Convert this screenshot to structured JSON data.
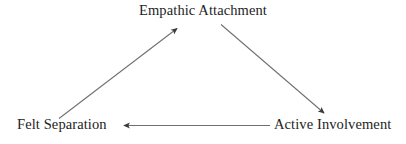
{
  "diagram": {
    "type": "cycle-triangle",
    "background_color": "#ffffff",
    "line_color": "#6b6b6b",
    "text_color": "#232323",
    "nodes": [
      {
        "id": "empathic-attachment",
        "label": "Empathic Attachment",
        "position": "top"
      },
      {
        "id": "felt-separation",
        "label": "Felt Separation",
        "position": "bottom-left"
      },
      {
        "id": "active-involvement",
        "label": "Active Involvement",
        "position": "bottom-right"
      }
    ],
    "edges": [
      {
        "id": "felt-separation-to-empathic-attachment",
        "from": "Felt Separation",
        "to": "Empathic Attachment",
        "direction": "up-right",
        "arrowhead": "to"
      },
      {
        "id": "empathic-attachment-to-active-involvement",
        "from": "Empathic Attachment",
        "to": "Active Involvement",
        "direction": "down-right",
        "arrowhead": "to"
      },
      {
        "id": "active-involvement-to-felt-separation",
        "from": "Active Involvement",
        "to": "Felt Separation",
        "direction": "left",
        "arrowhead": "to"
      }
    ]
  }
}
